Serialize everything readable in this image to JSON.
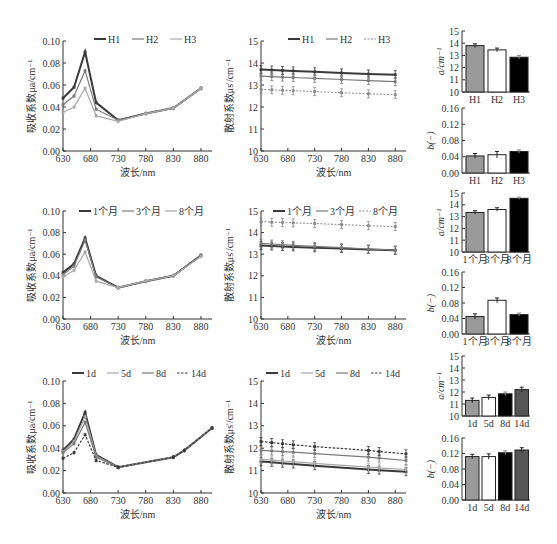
{
  "chart_data": [
    {
      "id": "abs-h",
      "type": "line",
      "xlabel": "波长/nm",
      "ylabel": "吸收系数μa/cm⁻¹",
      "ylim": [
        0,
        0.1
      ],
      "yticks": [
        "0.00",
        "0.02",
        "0.04",
        "0.06",
        "0.08",
        "0.10"
      ],
      "xlim": [
        630,
        900
      ],
      "xticks": [
        "630",
        "680",
        "730",
        "780",
        "830",
        "880"
      ],
      "legend_position": "top-right",
      "x": [
        630,
        650,
        670,
        690,
        730,
        780,
        830,
        880
      ],
      "series": [
        {
          "name": "H1",
          "style": "dark",
          "values": [
            0.048,
            0.058,
            0.09,
            0.044,
            0.028,
            0.034,
            0.039,
            0.057
          ]
        },
        {
          "name": "H2",
          "style": "mid",
          "values": [
            0.042,
            0.05,
            0.073,
            0.038,
            0.028,
            0.034,
            0.039,
            0.057
          ]
        },
        {
          "name": "H3",
          "style": "light",
          "values": [
            0.035,
            0.04,
            0.057,
            0.032,
            0.027,
            0.034,
            0.039,
            0.057
          ]
        }
      ]
    },
    {
      "id": "sca-h",
      "type": "line",
      "xlabel": "波长/nm",
      "ylabel": "散射系数μs'/cm⁻¹",
      "ylim": [
        10,
        15
      ],
      "yticks": [
        "10",
        "11",
        "12",
        "13",
        "14",
        "15"
      ],
      "xlim": [
        630,
        900
      ],
      "xticks": [
        "630",
        "680",
        "730",
        "780",
        "830",
        "880"
      ],
      "legend_position": "top-right",
      "x": [
        630,
        650,
        670,
        690,
        730,
        780,
        830,
        880
      ],
      "series": [
        {
          "name": "H1",
          "style": "dark",
          "values": [
            13.7,
            13.68,
            13.66,
            13.64,
            13.6,
            13.55,
            13.5,
            13.47
          ]
        },
        {
          "name": "H2",
          "style": "mid",
          "values": [
            13.4,
            13.38,
            13.36,
            13.34,
            13.3,
            13.25,
            13.2,
            13.15
          ]
        },
        {
          "name": "H3",
          "style": "light-dash",
          "values": [
            12.8,
            12.78,
            12.76,
            12.74,
            12.7,
            12.65,
            12.6,
            12.56
          ]
        }
      ]
    },
    {
      "id": "bar-a-h",
      "type": "bar",
      "ylabel": "a/cm⁻¹",
      "ylim": [
        10,
        15
      ],
      "yticks": [
        "10",
        "11",
        "12",
        "13",
        "14",
        "15"
      ],
      "categories": [
        "H1",
        "H2",
        "H3"
      ],
      "values": [
        13.8,
        13.45,
        12.85
      ],
      "errors": [
        0.15,
        0.15,
        0.15
      ],
      "fills": [
        "#9a9a9a",
        "#ffffff",
        "#000000"
      ]
    },
    {
      "id": "bar-b-h",
      "type": "bar",
      "ylabel": "b(−)",
      "ylim": [
        0,
        0.16
      ],
      "yticks": [
        "0.00",
        "0.04",
        "0.08",
        "0.12",
        "0.16"
      ],
      "categories": [
        "H1",
        "H2",
        "H3"
      ],
      "values": [
        0.042,
        0.045,
        0.053
      ],
      "errors": [
        0.006,
        0.008,
        0.004
      ],
      "fills": [
        "#9a9a9a",
        "#ffffff",
        "#000000"
      ]
    },
    {
      "id": "abs-m",
      "type": "line",
      "xlabel": "波长/nm",
      "ylabel": "吸收系数μa/cm⁻¹",
      "ylim": [
        0,
        0.1
      ],
      "yticks": [
        "0.00",
        "0.02",
        "0.04",
        "0.06",
        "0.08",
        "0.10"
      ],
      "xlim": [
        630,
        900
      ],
      "xticks": [
        "630",
        "680",
        "730",
        "780",
        "830",
        "880"
      ],
      "legend_position": "top-right",
      "x": [
        630,
        650,
        670,
        690,
        730,
        780,
        830,
        880
      ],
      "series": [
        {
          "name": "1个月",
          "style": "dark",
          "values": [
            0.043,
            0.051,
            0.075,
            0.04,
            0.029,
            0.035,
            0.04,
            0.059
          ]
        },
        {
          "name": "3个月",
          "style": "mid",
          "values": [
            0.041,
            0.049,
            0.073,
            0.039,
            0.029,
            0.035,
            0.04,
            0.059
          ]
        },
        {
          "name": "8个月",
          "style": "light",
          "values": [
            0.039,
            0.045,
            0.062,
            0.035,
            0.029,
            0.035,
            0.04,
            0.058
          ]
        }
      ]
    },
    {
      "id": "sca-m",
      "type": "line",
      "xlabel": "波长/nm",
      "ylabel": "散射系数μs'/cm⁻¹",
      "ylim": [
        10,
        15
      ],
      "yticks": [
        "10",
        "11",
        "12",
        "13",
        "14",
        "15"
      ],
      "xlim": [
        630,
        900
      ],
      "xticks": [
        "630",
        "680",
        "730",
        "780",
        "830",
        "880"
      ],
      "legend_position": "top-right",
      "x": [
        630,
        650,
        670,
        690,
        730,
        780,
        830,
        880
      ],
      "series": [
        {
          "name": "1个月",
          "style": "dark",
          "values": [
            13.4,
            13.38,
            13.36,
            13.34,
            13.3,
            13.26,
            13.22,
            13.18
          ]
        },
        {
          "name": "3个月",
          "style": "mid",
          "values": [
            13.5,
            13.47,
            13.44,
            13.41,
            13.36,
            13.3,
            13.24,
            13.19
          ]
        },
        {
          "name": "8个月",
          "style": "light-dash",
          "values": [
            14.5,
            14.48,
            14.47,
            14.45,
            14.42,
            14.37,
            14.32,
            14.28
          ]
        }
      ]
    },
    {
      "id": "bar-a-m",
      "type": "bar",
      "ylabel": "a/cm⁻¹",
      "ylim": [
        10,
        15
      ],
      "yticks": [
        "10",
        "11",
        "12",
        "13",
        "14",
        "15"
      ],
      "categories": [
        "1个月",
        "3个月",
        "8个月"
      ],
      "values": [
        13.35,
        13.6,
        14.55
      ],
      "errors": [
        0.15,
        0.15,
        0.1
      ],
      "fills": [
        "#9a9a9a",
        "#ffffff",
        "#000000"
      ]
    },
    {
      "id": "bar-b-m",
      "type": "bar",
      "ylabel": "b(−)",
      "ylim": [
        0,
        0.16
      ],
      "yticks": [
        "0.00",
        "0.04",
        "0.08",
        "0.12",
        "0.16"
      ],
      "categories": [
        "1个月",
        "3个月",
        "8个月"
      ],
      "values": [
        0.045,
        0.087,
        0.05
      ],
      "errors": [
        0.007,
        0.006,
        0.004
      ],
      "fills": [
        "#9a9a9a",
        "#ffffff",
        "#000000"
      ]
    },
    {
      "id": "abs-d",
      "type": "line",
      "xlabel": "波长/nm",
      "ylabel": "吸收系数μa/cm⁻¹",
      "ylim": [
        0,
        0.1
      ],
      "yticks": [
        "0.00",
        "0.02",
        "0.04",
        "0.06",
        "0.08",
        "0.10"
      ],
      "xlim": [
        630,
        900
      ],
      "xticks": [
        "630",
        "680",
        "730",
        "780",
        "830",
        "880"
      ],
      "legend_position": "top-right",
      "x": [
        630,
        650,
        670,
        690,
        730,
        830,
        850,
        900
      ],
      "series": [
        {
          "name": "1d",
          "style": "dark",
          "values": [
            0.038,
            0.048,
            0.072,
            0.034,
            0.023,
            0.032,
            0.038,
            0.058
          ]
        },
        {
          "name": "5d",
          "style": "light",
          "values": [
            0.037,
            0.046,
            0.068,
            0.033,
            0.023,
            0.032,
            0.038,
            0.058
          ]
        },
        {
          "name": "8d",
          "style": "mid",
          "values": [
            0.036,
            0.044,
            0.063,
            0.032,
            0.023,
            0.032,
            0.038,
            0.058
          ]
        },
        {
          "name": "14d",
          "style": "dash",
          "values": [
            0.031,
            0.036,
            0.052,
            0.029,
            0.023,
            0.032,
            0.038,
            0.058
          ]
        }
      ]
    },
    {
      "id": "sca-d",
      "type": "line",
      "xlabel": "波长/nm",
      "ylabel": "散射系数μs'/cm⁻¹",
      "ylim": [
        10,
        15
      ],
      "yticks": [
        "10",
        "11",
        "12",
        "13",
        "14",
        "15"
      ],
      "xlim": [
        630,
        900
      ],
      "xticks": [
        "630",
        "680",
        "730",
        "780",
        "830",
        "880"
      ],
      "legend_position": "top-right",
      "x": [
        630,
        650,
        670,
        690,
        730,
        830,
        850,
        900
      ],
      "series": [
        {
          "name": "1d",
          "style": "dark",
          "values": [
            11.4,
            11.37,
            11.33,
            11.3,
            11.22,
            11.05,
            11.02,
            10.95
          ]
        },
        {
          "name": "5d",
          "style": "light",
          "values": [
            11.5,
            11.47,
            11.43,
            11.4,
            11.32,
            11.15,
            11.12,
            11.05
          ]
        },
        {
          "name": "8d",
          "style": "mid",
          "values": [
            11.9,
            11.88,
            11.85,
            11.82,
            11.76,
            11.6,
            11.56,
            11.45
          ]
        },
        {
          "name": "14d",
          "style": "dash",
          "values": [
            12.3,
            12.25,
            12.2,
            12.15,
            12.07,
            11.9,
            11.85,
            11.75
          ]
        }
      ]
    },
    {
      "id": "bar-a-d",
      "type": "bar",
      "ylabel": "a/cm⁻¹",
      "ylim": [
        10,
        15
      ],
      "yticks": [
        "10",
        "11",
        "12",
        "13",
        "14",
        "15"
      ],
      "categories": [
        "1d",
        "5d",
        "8d",
        "14d"
      ],
      "values": [
        11.3,
        11.55,
        11.85,
        12.2
      ],
      "errors": [
        0.2,
        0.2,
        0.15,
        0.2
      ],
      "fills": [
        "#9a9a9a",
        "#ffffff",
        "#000000",
        "#555555"
      ]
    },
    {
      "id": "bar-b-d",
      "type": "bar",
      "ylabel": "b(−)",
      "ylim": [
        0,
        0.16
      ],
      "yticks": [
        "0.00",
        "0.04",
        "0.08",
        "0.12",
        "0.16"
      ],
      "categories": [
        "1d",
        "5d",
        "8d",
        "14d"
      ],
      "values": [
        0.112,
        0.112,
        0.122,
        0.129
      ],
      "errors": [
        0.006,
        0.007,
        0.005,
        0.006
      ],
      "fills": [
        "#9a9a9a",
        "#ffffff",
        "#000000",
        "#555555"
      ]
    }
  ]
}
